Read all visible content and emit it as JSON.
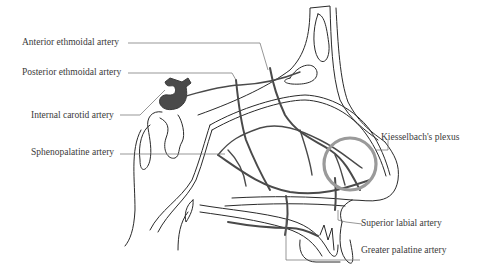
{
  "diagram": {
    "labels": {
      "anterior_ethmoidal": "Anterior ethmoidal artery",
      "posterior_ethmoidal": "Posterior ethmoidal artery",
      "internal_carotid": "Internal carotid artery",
      "sphenopalatine": "Sphenopalatine artery",
      "kiesselbach": "Kiesselbach's plexus",
      "superior_labial": "Superior labial artery",
      "greater_palatine": "Greater palatine artery"
    },
    "colors": {
      "outline": "#2a2a2a",
      "artery": "#4a4a4a",
      "plexus_ring": "#9a9a9a",
      "label_text": "#3a3a3a",
      "background": "#ffffff"
    }
  }
}
